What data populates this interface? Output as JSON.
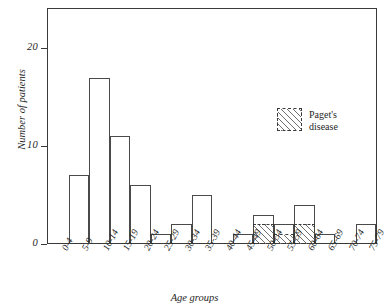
{
  "chart_data": {
    "type": "bar",
    "title": "",
    "xlabel": "Age groups",
    "ylabel": "Number of patients",
    "categories": [
      "0-4",
      "5-9",
      "10-14",
      "15-19",
      "20-24",
      "25-29",
      "30-34",
      "35-39",
      "40-44",
      "45-49",
      "50-54",
      "55-59",
      "60-64",
      "65-69",
      "70-74",
      "75-79"
    ],
    "series": [
      {
        "name": "Total patients",
        "values": [
          0,
          7,
          17,
          11,
          6,
          1,
          2,
          5,
          0,
          1,
          3,
          2,
          4,
          1,
          0,
          2
        ]
      },
      {
        "name": "Paget's disease",
        "values": [
          0,
          0,
          0,
          0,
          0,
          0,
          0,
          0,
          0,
          0,
          2,
          1,
          2,
          0,
          0,
          0
        ]
      }
    ],
    "ylim": [
      0,
      24
    ],
    "yticks": [
      0,
      10,
      20
    ],
    "ytick_labels": [
      "0",
      "10",
      "20"
    ],
    "grid": false,
    "legend_position": "upper-right"
  },
  "axes": {
    "y_label": "Number of patients",
    "x_label": "Age groups",
    "y_ticks": [
      {
        "value": 0,
        "label": "0"
      },
      {
        "value": 10,
        "label": "10"
      },
      {
        "value": 20,
        "label": "20"
      }
    ],
    "x_tick_labels": [
      "0-4",
      "5-9",
      "10-14",
      "15-19",
      "20-24",
      "25-29",
      "30-34",
      "35-39",
      "40-44",
      "45-49",
      "50-54",
      "55-59",
      "60-64",
      "65-69",
      "70-74",
      "75-79"
    ]
  },
  "legend": {
    "entries": [
      {
        "swatch": "hatched-box",
        "line1": "Paget's",
        "line2": "disease"
      }
    ]
  },
  "colors": {
    "axis": "#3a3a3a",
    "bar_outline": "#4a4a4a",
    "hatch": "#6f6f6f",
    "text": "#262626",
    "background": "#ffffff"
  }
}
